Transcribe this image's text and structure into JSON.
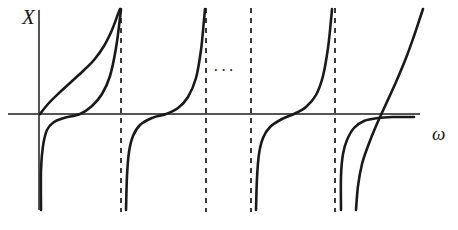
{
  "figure": {
    "title": "",
    "caption": ""
  },
  "labels": {
    "y_axis": "X",
    "x_axis": "ω",
    "ellipsis": "···"
  },
  "colors": {
    "curve": "#1a1a1a",
    "axis": "#555555",
    "asymptote": "#3a3a3a",
    "background": "#ffffff"
  },
  "chart_data": {
    "type": "line",
    "title": "",
    "xlabel": "ω",
    "ylabel": "X",
    "grid": false,
    "legend": null,
    "axis_pixels": {
      "origin": [
        39,
        114
      ],
      "x_axis_from": [
        8,
        114
      ],
      "x_axis_to": [
        420,
        114
      ],
      "y_axis_from": [
        39,
        10
      ],
      "y_axis_to": [
        39,
        210
      ]
    },
    "asymptotes": {
      "style": "dashed",
      "x_pixels": [
        121,
        206,
        251,
        335
      ]
    },
    "ellipsis_position_pixels": [
      225,
      72
    ],
    "annotations": [
      {
        "text": "X",
        "x": 22,
        "y": 24
      },
      {
        "text": "ω",
        "x": 432,
        "y": 140
      }
    ],
    "series": [
      {
        "name": "branch-1-lower-slow",
        "comment": "shallow curve rising from origin toward first pole",
        "points_pixels": [
          [
            40,
            114
          ],
          [
            48,
            104
          ],
          [
            58,
            94
          ],
          [
            70,
            83
          ],
          [
            82,
            72
          ],
          [
            94,
            60
          ],
          [
            104,
            46
          ],
          [
            112,
            30
          ],
          [
            118,
            14
          ],
          [
            120,
            9
          ]
        ]
      },
      {
        "name": "branch-1-steep",
        "comment": "steep branch from -infinity at y-axis through zero at x=80 up to first pole",
        "points_pixels": [
          [
            41,
            210
          ],
          [
            41,
            170
          ],
          [
            43,
            146
          ],
          [
            47,
            130
          ],
          [
            54,
            122
          ],
          [
            64,
            118
          ],
          [
            80,
            114
          ],
          [
            92,
            106
          ],
          [
            102,
            94
          ],
          [
            110,
            76
          ],
          [
            116,
            48
          ],
          [
            120,
            18
          ],
          [
            121,
            9
          ]
        ]
      },
      {
        "name": "branch-2",
        "comment": "between first and second pole",
        "points_pixels": [
          [
            126,
            210
          ],
          [
            127,
            176
          ],
          [
            129,
            152
          ],
          [
            133,
            136
          ],
          [
            140,
            125
          ],
          [
            152,
            118
          ],
          [
            166,
            114
          ],
          [
            178,
            108
          ],
          [
            188,
            97
          ],
          [
            196,
            78
          ],
          [
            201,
            50
          ],
          [
            204,
            20
          ],
          [
            205,
            9
          ]
        ]
      },
      {
        "name": "branch-3",
        "comment": "between third dashed pole and fourth pole",
        "points_pixels": [
          [
            256,
            210
          ],
          [
            257,
            178
          ],
          [
            259,
            154
          ],
          [
            263,
            138
          ],
          [
            270,
            127
          ],
          [
            282,
            119
          ],
          [
            294,
            114
          ],
          [
            306,
            107
          ],
          [
            316,
            95
          ],
          [
            323,
            76
          ],
          [
            328,
            48
          ],
          [
            331,
            20
          ],
          [
            332,
            9
          ]
        ]
      },
      {
        "name": "branch-4-shallow",
        "comment": "shallow branch after last pole flattening toward axis",
        "points_pixels": [
          [
            341,
            210
          ],
          [
            341,
            176
          ],
          [
            343,
            154
          ],
          [
            347,
            140
          ],
          [
            354,
            128
          ],
          [
            364,
            121
          ],
          [
            378,
            118
          ],
          [
            394,
            117
          ],
          [
            408,
            117
          ],
          [
            414,
            117
          ]
        ]
      },
      {
        "name": "branch-4-steep",
        "comment": "steep final branch crossing axis and rising off the top right",
        "points_pixels": [
          [
            356,
            210
          ],
          [
            358,
            186
          ],
          [
            362,
            164
          ],
          [
            368,
            146
          ],
          [
            376,
            126
          ],
          [
            386,
            104
          ],
          [
            396,
            82
          ],
          [
            406,
            58
          ],
          [
            414,
            36
          ],
          [
            420,
            18
          ],
          [
            423,
            9
          ]
        ]
      }
    ]
  }
}
